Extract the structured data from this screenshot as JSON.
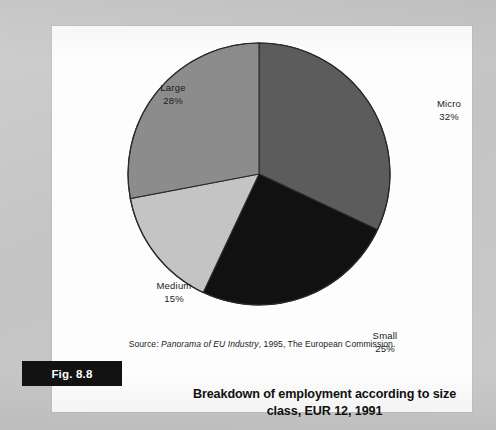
{
  "figure": {
    "label": "Fig. 8.8",
    "title_line1": "Breakdown of employment according to size",
    "title_line2": "class, EUR 12, 1991",
    "source_prefix": "Source: ",
    "source_italic": "Panorama of EU Industry",
    "source_suffix": ", 1995, The European Commission."
  },
  "labels": {
    "micro_name": "Micro",
    "micro_pct": "32%",
    "small_name": "Small",
    "small_pct": "25%",
    "medium_name": "Medium",
    "medium_pct": "15%",
    "large_name": "Large",
    "large_pct": "28%"
  },
  "colors": {
    "micro": "#5c5c5c",
    "small": "#111111",
    "medium": "#c4c4c4",
    "large": "#8c8c8c",
    "outline": "#2a2a2a",
    "page": "#fdfdfd",
    "backdrop": "#c9c9c9",
    "fig_bar": "#121212"
  },
  "chart_data": {
    "type": "pie",
    "title": "Breakdown of employment according to size class, EUR 12, 1991",
    "subtitle": "",
    "xlabel": "",
    "ylabel": "",
    "unit": "%",
    "start_angle_deg": 0,
    "direction": "clockwise",
    "legend_position": "none",
    "grid": false,
    "labels_shown": "name and percentage outside slices",
    "categories": [
      "Micro",
      "Small",
      "Medium",
      "Large"
    ],
    "values": [
      32,
      25,
      15,
      28
    ],
    "total": 100,
    "slices": [
      {
        "name": "Micro",
        "value": 32,
        "display": "32%",
        "color": "#5c5c5c",
        "start_deg": 0,
        "end_deg": 115.2
      },
      {
        "name": "Small",
        "value": 25,
        "display": "25%",
        "color": "#111111",
        "start_deg": 115.2,
        "end_deg": 205.2
      },
      {
        "name": "Medium",
        "value": 15,
        "display": "15%",
        "color": "#c4c4c4",
        "start_deg": 205.2,
        "end_deg": 259.2
      },
      {
        "name": "Large",
        "value": 28,
        "display": "28%",
        "color": "#8c8c8c",
        "start_deg": 259.2,
        "end_deg": 360
      }
    ],
    "source": "Source: Panorama of EU Industry, 1995, The European Commission."
  }
}
